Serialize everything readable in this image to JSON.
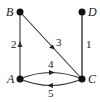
{
  "diagram": {
    "type": "directed-graph",
    "colors": {
      "node": "#111111",
      "edge": "#333333",
      "edge_light": "#555555",
      "background": "#ffffff"
    },
    "nodes": [
      {
        "id": "A",
        "label": "A",
        "x": 20,
        "y": 79
      },
      {
        "id": "B",
        "label": "B",
        "x": 20,
        "y": 12
      },
      {
        "id": "C",
        "label": "C",
        "x": 82,
        "y": 79
      },
      {
        "id": "D",
        "label": "D",
        "x": 82,
        "y": 12
      }
    ],
    "edges": [
      {
        "from": "D",
        "to": "C",
        "label": "1",
        "directed": false
      },
      {
        "from": "A",
        "to": "B",
        "label": "2",
        "directed": true
      },
      {
        "from": "B",
        "to": "C",
        "label": "3",
        "directed": true
      },
      {
        "from": "A",
        "to": "C",
        "label": "4",
        "directed": true,
        "curve": "upper"
      },
      {
        "from": "C",
        "to": "A",
        "label": "5",
        "directed": true,
        "curve": "lower"
      }
    ]
  }
}
